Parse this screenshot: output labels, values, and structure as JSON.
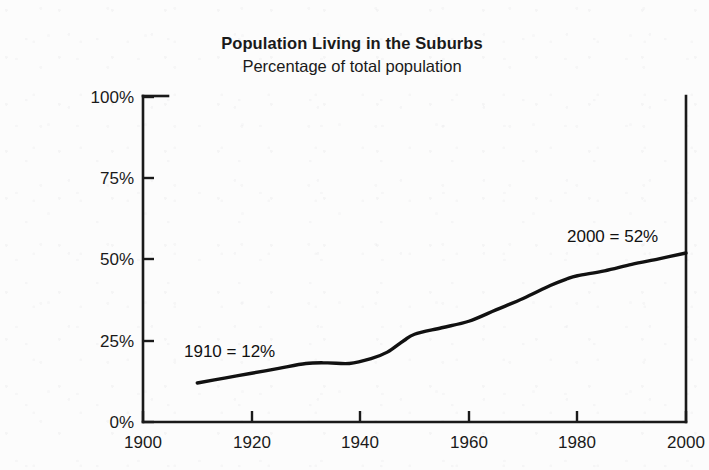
{
  "chart_data": {
    "type": "line",
    "title": "Population Living in the Suburbs",
    "subtitle": "Percentage of total population",
    "xlabel": "",
    "ylabel": "",
    "xlim": [
      1900,
      2000
    ],
    "ylim": [
      0,
      100
    ],
    "grid": false,
    "legend": "none",
    "x_ticks": [
      "1900",
      "1920",
      "1940",
      "1960",
      "1980",
      "2000"
    ],
    "x_tick_values": [
      1900,
      1920,
      1940,
      1960,
      1980,
      2000
    ],
    "y_ticks": [
      "0%",
      "25%",
      "50%",
      "75%",
      "100%"
    ],
    "y_tick_values": [
      0,
      25,
      50,
      75,
      100
    ],
    "series": [
      {
        "name": "Percentage of total population living in the suburbs",
        "color": "#111111",
        "x": [
          1910,
          1915,
          1920,
          1925,
          1930,
          1934,
          1938,
          1942,
          1945,
          1948,
          1950,
          1955,
          1960,
          1965,
          1970,
          1975,
          1978,
          1980,
          1985,
          1990,
          1995,
          2000
        ],
        "values": [
          12,
          13.5,
          15,
          16.5,
          18,
          18.2,
          18,
          19.5,
          21.5,
          25,
          27,
          29,
          31,
          34.5,
          38,
          42,
          44,
          45,
          46.5,
          48.5,
          50.2,
          52
        ]
      }
    ],
    "annotations": [
      {
        "text": "1910 = 12%",
        "x": 1910,
        "y": 12,
        "position": "above-right-of-start"
      },
      {
        "text": "2000 = 52%",
        "x": 2000,
        "y": 52,
        "position": "above-left-of-end"
      }
    ]
  },
  "axes": {
    "y_tick_0": "0%",
    "y_tick_1": "25%",
    "y_tick_2": "50%",
    "y_tick_3": "75%",
    "y_tick_4": "100%",
    "x_tick_0": "1900",
    "x_tick_1": "1920",
    "x_tick_2": "1940",
    "x_tick_3": "1960",
    "x_tick_4": "1980",
    "x_tick_5": "2000"
  },
  "annotations": {
    "start_label": "1910 = 12%",
    "end_label": "2000 = 52%"
  },
  "colors": {
    "line": "#111111",
    "axis": "#1a1a1a",
    "background": "#fcfcfc",
    "text": "#1a1a1a"
  }
}
